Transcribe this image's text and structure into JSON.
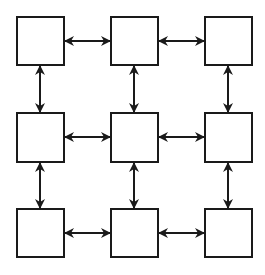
{
  "diagram": {
    "type": "grid-graph",
    "rows": 3,
    "cols": 3,
    "colors": {
      "stroke": "#1a1a1a",
      "fill": "#ffffff",
      "background": "#ffffff"
    },
    "nodes": [
      {
        "id": "r1c1",
        "x": 17,
        "y": 17,
        "w": 47,
        "h": 48
      },
      {
        "id": "r1c2",
        "x": 111,
        "y": 17,
        "w": 47,
        "h": 48
      },
      {
        "id": "r1c3",
        "x": 205,
        "y": 17,
        "w": 47,
        "h": 48
      },
      {
        "id": "r2c1",
        "x": 17,
        "y": 113,
        "w": 47,
        "h": 49
      },
      {
        "id": "r2c2",
        "x": 111,
        "y": 113,
        "w": 47,
        "h": 49
      },
      {
        "id": "r2c3",
        "x": 205,
        "y": 113,
        "w": 47,
        "h": 49
      },
      {
        "id": "r3c1",
        "x": 17,
        "y": 209,
        "w": 47,
        "h": 48
      },
      {
        "id": "r3c2",
        "x": 111,
        "y": 209,
        "w": 47,
        "h": 48
      },
      {
        "id": "r3c3",
        "x": 205,
        "y": 209,
        "w": 47,
        "h": 48
      }
    ],
    "edges": [
      {
        "from": "r1c1",
        "to": "r1c2",
        "direction": "bidirectional",
        "x1": 65,
        "y1": 41,
        "x2": 110,
        "y2": 41
      },
      {
        "from": "r1c2",
        "to": "r1c3",
        "direction": "bidirectional",
        "x1": 159,
        "y1": 41,
        "x2": 204,
        "y2": 41
      },
      {
        "from": "r2c1",
        "to": "r2c2",
        "direction": "bidirectional",
        "x1": 65,
        "y1": 137,
        "x2": 110,
        "y2": 137
      },
      {
        "from": "r2c2",
        "to": "r2c3",
        "direction": "bidirectional",
        "x1": 159,
        "y1": 137,
        "x2": 204,
        "y2": 137
      },
      {
        "from": "r3c1",
        "to": "r3c2",
        "direction": "bidirectional",
        "x1": 65,
        "y1": 233,
        "x2": 110,
        "y2": 233
      },
      {
        "from": "r3c2",
        "to": "r3c3",
        "direction": "bidirectional",
        "x1": 159,
        "y1": 233,
        "x2": 204,
        "y2": 233
      },
      {
        "from": "r1c1",
        "to": "r2c1",
        "direction": "bidirectional",
        "x1": 40,
        "y1": 66,
        "x2": 40,
        "y2": 112
      },
      {
        "from": "r2c1",
        "to": "r3c1",
        "direction": "bidirectional",
        "x1": 40,
        "y1": 163,
        "x2": 40,
        "y2": 208
      },
      {
        "from": "r1c2",
        "to": "r2c2",
        "direction": "bidirectional",
        "x1": 134,
        "y1": 66,
        "x2": 134,
        "y2": 112
      },
      {
        "from": "r2c2",
        "to": "r3c2",
        "direction": "bidirectional",
        "x1": 134,
        "y1": 163,
        "x2": 134,
        "y2": 208
      },
      {
        "from": "r1c3",
        "to": "r2c3",
        "direction": "bidirectional",
        "x1": 228,
        "y1": 66,
        "x2": 228,
        "y2": 112
      },
      {
        "from": "r2c3",
        "to": "r3c3",
        "direction": "bidirectional",
        "x1": 228,
        "y1": 163,
        "x2": 228,
        "y2": 208
      }
    ]
  }
}
